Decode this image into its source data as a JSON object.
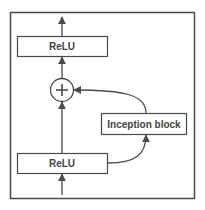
{
  "diagram": {
    "type": "residual-inception-block",
    "colors": {
      "stroke": "#4a4a4a",
      "background": "#ffffff",
      "text": "#444444"
    },
    "nodes": [
      {
        "id": "relu_top",
        "label": "ReLU",
        "shape": "rect"
      },
      {
        "id": "add",
        "label": "+",
        "shape": "circle"
      },
      {
        "id": "inception",
        "label": "Inception block",
        "shape": "rect"
      },
      {
        "id": "relu_bottom",
        "label": "ReLU",
        "shape": "rect"
      }
    ],
    "edges": [
      {
        "from": "input",
        "to": "relu_bottom"
      },
      {
        "from": "relu_bottom",
        "to": "add",
        "kind": "identity-shortcut"
      },
      {
        "from": "relu_bottom",
        "to": "inception",
        "kind": "curve"
      },
      {
        "from": "inception",
        "to": "add",
        "kind": "curve"
      },
      {
        "from": "add",
        "to": "relu_top"
      },
      {
        "from": "relu_top",
        "to": "output"
      }
    ]
  },
  "labels": {
    "relu_top": "ReLU",
    "add": "+",
    "inception": "Inception block",
    "relu_bottom": "ReLU"
  }
}
